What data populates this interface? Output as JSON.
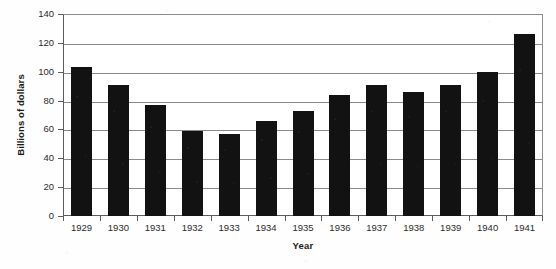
{
  "chart_data": {
    "type": "bar",
    "title": "",
    "xlabel": "Year",
    "ylabel": "Billions of dollars",
    "categories": [
      "1929",
      "1930",
      "1931",
      "1932",
      "1933",
      "1934",
      "1935",
      "1936",
      "1937",
      "1938",
      "1939",
      "1940",
      "1941"
    ],
    "values": [
      103,
      91,
      77,
      59,
      57,
      66,
      73,
      84,
      91,
      86,
      91,
      100,
      126
    ],
    "series": [
      {
        "name": "Billions of dollars",
        "values": [
          103,
          91,
          77,
          59,
          57,
          66,
          73,
          84,
          91,
          86,
          91,
          100,
          126
        ]
      }
    ],
    "ylim": [
      0,
      140
    ],
    "ytick_values": [
      0,
      20,
      40,
      60,
      80,
      100,
      120,
      140
    ],
    "ytick_labels": [
      "0",
      "20",
      "40",
      "60",
      "80",
      "100",
      "120",
      "140"
    ],
    "grid": "horizontal",
    "legend": "none",
    "bar_color": "#121212",
    "gridline_color": "#8a8a8a",
    "axis_color": "#5c5c5c",
    "background_color": "#ffffff"
  }
}
